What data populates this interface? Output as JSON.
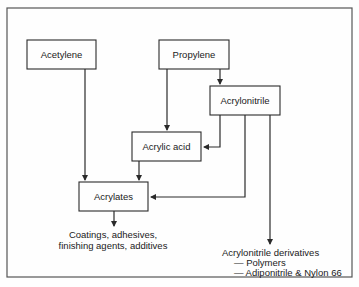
{
  "diagram": {
    "nodes": {
      "acetylene": "Acetylene",
      "propylene": "Propylene",
      "acrylonitrile": "Acrylonitrile",
      "acrylic_acid": "Acrylic acid",
      "acrylates": "Acrylates"
    },
    "outputs": {
      "acrylates_uses": [
        "Coatings, adhesives,",
        "finishing agents, additives"
      ],
      "acrylonitrile_derivatives": {
        "title": "Acrylonitrile derivatives",
        "items": [
          "— Polymers",
          "— Adiponitrile & Nylon 66"
        ]
      }
    },
    "edges": [
      {
        "from": "Acetylene",
        "to": "Acrylates"
      },
      {
        "from": "Propylene",
        "to": "Acrylic acid"
      },
      {
        "from": "Propylene",
        "to": "Acrylonitrile"
      },
      {
        "from": "Acrylonitrile",
        "to": "Acrylic acid"
      },
      {
        "from": "Acrylonitrile",
        "to": "Acrylates"
      },
      {
        "from": "Acrylonitrile",
        "to": "Acrylonitrile derivatives"
      },
      {
        "from": "Acrylic acid",
        "to": "Acrylates"
      },
      {
        "from": "Acrylates",
        "to": "Coatings, adhesives, finishing agents, additives"
      }
    ]
  }
}
